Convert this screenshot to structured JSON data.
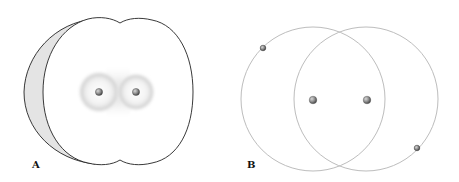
{
  "figure": {
    "panels": [
      {
        "label": "A",
        "description": "electron-cloud",
        "nuclei": [
          {
            "x": 99,
            "y": 92
          },
          {
            "x": 136,
            "y": 92
          }
        ]
      },
      {
        "label": "B",
        "description": "orbit-model",
        "orbits": [
          {
            "cx": 313,
            "cy": 99,
            "r": 72
          },
          {
            "cx": 366,
            "cy": 99,
            "r": 72
          }
        ],
        "nuclei": [
          {
            "x": 313,
            "y": 100
          },
          {
            "x": 367,
            "y": 100
          }
        ],
        "electrons": [
          {
            "x": 263,
            "y": 48
          },
          {
            "x": 417,
            "y": 148
          }
        ]
      }
    ],
    "colors": {
      "outline": "#222222",
      "orbit": "#bdbdbd",
      "rim_shade": "#e2e2e2",
      "cloud": "#b8b8b8",
      "ball": "#8a8a8a"
    }
  }
}
